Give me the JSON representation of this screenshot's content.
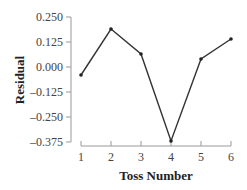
{
  "chart_data": {
    "type": "line",
    "title": "",
    "xlabel": "Toss Number",
    "ylabel": "Residual",
    "x": [
      1,
      2,
      3,
      4,
      5,
      6
    ],
    "categories": [
      "1",
      "2",
      "3",
      "4",
      "5",
      "6"
    ],
    "series": [
      {
        "name": "Residual",
        "values": [
          -0.04,
          0.19,
          0.065,
          -0.37,
          0.04,
          0.14
        ]
      }
    ],
    "yticks": [
      "0.250",
      "0.125",
      "0.000",
      "–0.125",
      "–0.250",
      "–0.375"
    ],
    "ytick_values": [
      0.25,
      0.125,
      0,
      -0.125,
      -0.25,
      -0.375
    ],
    "xticks": [
      "1",
      "2",
      "3",
      "4",
      "5",
      "6"
    ],
    "ylim": [
      -0.375,
      0.25
    ],
    "xlim": [
      1,
      6
    ],
    "grid": false,
    "legend": false,
    "colors": {
      "line": "#333333",
      "axis": "#999999",
      "marker": "#222222"
    }
  }
}
